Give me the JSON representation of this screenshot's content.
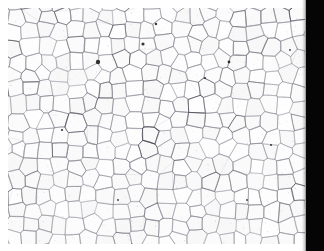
{
  "image": {
    "kind": "micrograph",
    "subject": "polycrystalline-grain-structure",
    "caption": "",
    "width": 324,
    "height": 251
  },
  "colors": {
    "background": "#ffffff",
    "scan_field": "#fdfdfd",
    "grain_interior": "#fbfbfb",
    "grain_boundary": "#8b8b95",
    "grain_boundary_dark": "#4a4a55",
    "inclusion": "#1a1a1a",
    "film_edge": "#050505",
    "margin": "#ffffff"
  },
  "layout": {
    "specimen_left": 8,
    "specimen_top": 8,
    "specimen_width": 297,
    "specimen_height": 236,
    "film_edge_left": 306,
    "film_edge_width": 18,
    "margin_top": 8,
    "margin_left": 8,
    "margin_bottom": 7
  },
  "microstructure": {
    "boundary_width_px": 0.7,
    "mean_grain_diameter_px": 15,
    "grain_count_estimate": 430,
    "seed_count": 430,
    "jitter": 0.58,
    "noise_opacity": 0.28,
    "inclusions": [
      {
        "x": 98,
        "y": 62,
        "r": 2.2
      },
      {
        "x": 143,
        "y": 44,
        "r": 1.6
      },
      {
        "x": 229,
        "y": 62,
        "r": 1.4
      },
      {
        "x": 156,
        "y": 24,
        "r": 1.2
      },
      {
        "x": 62,
        "y": 130,
        "r": 1.1
      },
      {
        "x": 205,
        "y": 78,
        "r": 1.0
      },
      {
        "x": 271,
        "y": 145,
        "r": 1.0
      },
      {
        "x": 118,
        "y": 200,
        "r": 0.9
      },
      {
        "x": 247,
        "y": 200,
        "r": 0.9
      },
      {
        "x": 290,
        "y": 50,
        "r": 0.9
      }
    ]
  }
}
